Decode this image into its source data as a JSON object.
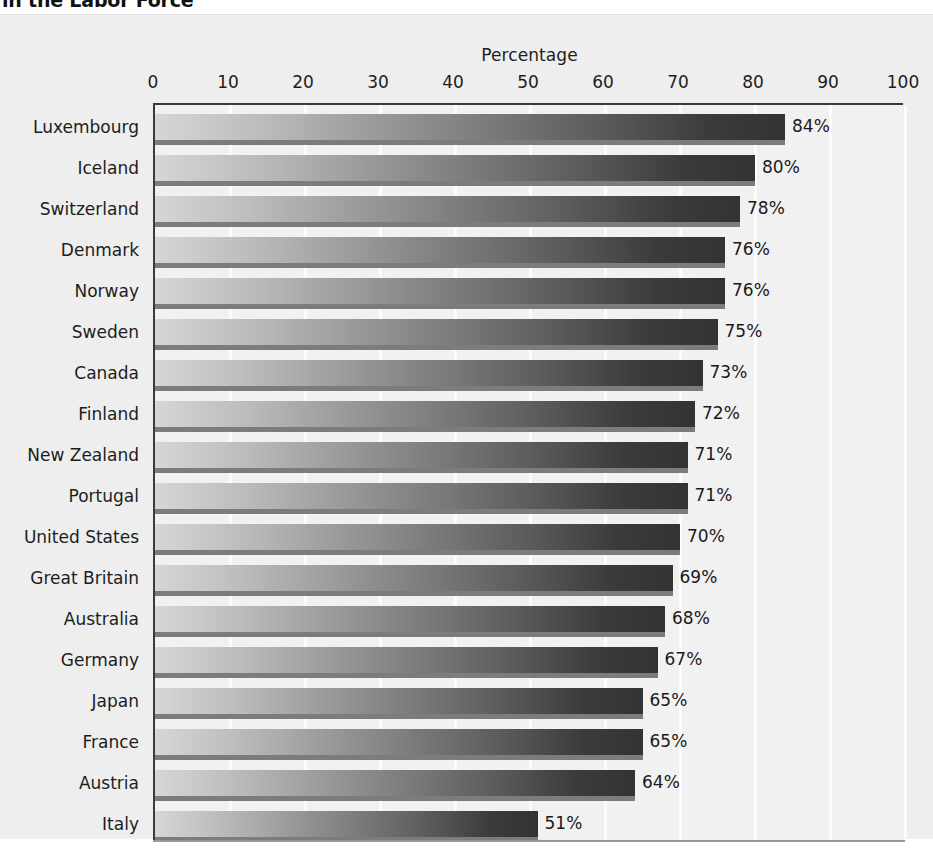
{
  "figure": {
    "cut_off_title": "in the Labor Force",
    "background_color": "#eeeeee",
    "plot_background_color": "#f1f1f1",
    "bar_color_light": "#d6d6d6",
    "bar_color_dark": "#333333",
    "gridline_color": "#fcfcfc",
    "axis_color": "#3a3a3a",
    "text_color": "#1d1d1d"
  },
  "chart_data": {
    "type": "bar",
    "orientation": "horizontal",
    "title": "in the Labor Force",
    "xlabel": "Percentage",
    "ylabel": "",
    "xlim": [
      0,
      100
    ],
    "xticks": [
      0,
      10,
      20,
      30,
      40,
      50,
      60,
      70,
      80,
      90,
      100
    ],
    "xtick_labels": [
      "0",
      "10",
      "20",
      "30",
      "40",
      "50",
      "60",
      "70",
      "80",
      "90",
      "100"
    ],
    "grid": true,
    "grid_axis": "x",
    "legend": null,
    "value_label_suffix": "%",
    "categories": [
      "Luxembourg",
      "Iceland",
      "Switzerland",
      "Denmark",
      "Norway",
      "Sweden",
      "Canada",
      "Finland",
      "New Zealand",
      "Portugal",
      "United States",
      "Great Britain",
      "Australia",
      "Germany",
      "Japan",
      "France",
      "Austria",
      "Italy"
    ],
    "values": [
      84,
      80,
      78,
      76,
      76,
      75,
      73,
      72,
      71,
      71,
      70,
      69,
      68,
      67,
      65,
      65,
      64,
      51
    ],
    "value_labels": [
      "84%",
      "80%",
      "78%",
      "76%",
      "76%",
      "75%",
      "73%",
      "72%",
      "71%",
      "71%",
      "70%",
      "69%",
      "68%",
      "67%",
      "65%",
      "65%",
      "64%",
      "51%"
    ]
  }
}
